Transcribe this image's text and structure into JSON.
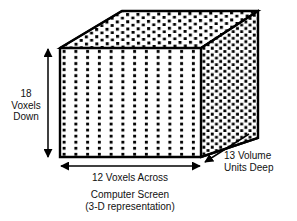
{
  "figure": {
    "type": "3d-voxel-cube-diagram",
    "title_caption_line1": "Computer Screen",
    "title_caption_line2": "(3-D representation)",
    "labels": {
      "height_label": "18\nVoxels\nDown",
      "height_value": 18,
      "height_unit": "Voxels Down",
      "width_label": "12 Voxels Across",
      "width_value": 12,
      "width_unit": "Voxels Across",
      "depth_label_line1": "13 Volume",
      "depth_label_line2": "Units Deep",
      "depth_value": 13,
      "depth_unit": "Volume Units Deep"
    },
    "colors": {
      "stroke": "#000000",
      "fill": "#ffffff",
      "dot": "#000000",
      "text": "#111111"
    },
    "geometry": {
      "front_face": {
        "x": 60,
        "y": 48,
        "width": 141,
        "height": 109,
        "cols": 12,
        "rows": 18
      },
      "top_face": {
        "points": "60,48 122,11 258,11 201,48"
      },
      "right_face": {
        "points": "201,48 258,11 258,138 201,157"
      },
      "arrows": {
        "vertical": {
          "x": 48,
          "y1": 48,
          "y2": 158
        },
        "horizontal": {
          "y": 166,
          "x1": 60,
          "x2": 201
        },
        "diagonal": {
          "x1": 249,
          "y1": 134,
          "x2": 204,
          "y2": 163
        }
      }
    }
  }
}
